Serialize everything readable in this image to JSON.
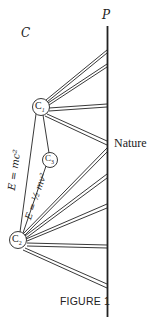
{
  "figure": {
    "caption": "FIGURE 1",
    "axis_label": "P",
    "region_label": "C",
    "axis_point_label": "Nature",
    "nodes": [
      {
        "id": "C1",
        "base": "C",
        "sub": "1"
      },
      {
        "id": "C3",
        "base": "C",
        "sub": "3"
      },
      {
        "id": "C2",
        "base": "C",
        "sub": "2"
      }
    ],
    "edge_labels": {
      "c1_c2": "E = mc²",
      "c3_c2": "E = ½ mv²"
    },
    "colors": {
      "line": "#222222",
      "background": "#ffffff"
    }
  }
}
